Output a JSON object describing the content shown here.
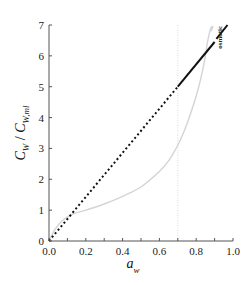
{
  "chart_data": {
    "type": "line",
    "title": "",
    "xlabel": "a_w",
    "ylabel": "C_W / C_W,ml",
    "xlim": [
      0.0,
      1.0
    ],
    "ylim": [
      0,
      7
    ],
    "grid": false,
    "legend": null,
    "x_ticks": [
      "0.0",
      "0.2",
      "0.4",
      "0.6",
      "0.8",
      "1.0"
    ],
    "x_minor_ticks": [
      0.1,
      0.3,
      0.5,
      0.7,
      0.9
    ],
    "y_ticks": [
      "0",
      "1",
      "2",
      "3",
      "4",
      "5",
      "6",
      "7"
    ],
    "series": [
      {
        "name": "linear (dashed, a_w < 0.7)",
        "style": "dashed",
        "color": "#111111",
        "x": [
          0.0,
          0.7
        ],
        "y": [
          0.0,
          5.0
        ]
      },
      {
        "name": "osmotic (solid, a_w > 0.7)",
        "style": "solid",
        "color": "#111111",
        "x": [
          0.7,
          0.9,
          0.91,
          0.97
        ],
        "y": [
          5.0,
          6.45,
          6.55,
          7.0
        ]
      },
      {
        "name": "sorption isotherm (gray)",
        "style": "solid",
        "color": "#d2d2d2",
        "x": [
          0.0,
          0.03,
          0.07,
          0.12,
          0.2,
          0.3,
          0.4,
          0.5,
          0.6,
          0.65,
          0.7,
          0.75,
          0.8,
          0.83,
          0.85,
          0.86,
          0.87,
          0.88,
          0.89,
          0.88
        ],
        "y": [
          0.0,
          0.35,
          0.65,
          0.85,
          1.0,
          1.2,
          1.45,
          1.75,
          2.25,
          2.6,
          3.1,
          3.8,
          4.7,
          5.4,
          6.0,
          6.4,
          6.7,
          6.9,
          6.95,
          6.8
        ]
      }
    ],
    "reference_lines": [
      {
        "orientation": "vertical",
        "x": 0.7,
        "style": "dotted",
        "color": "#dddddd"
      }
    ],
    "annotations": [
      {
        "text": "osmotic",
        "x": 0.94,
        "y": 6.6,
        "rotation": -90
      }
    ]
  }
}
